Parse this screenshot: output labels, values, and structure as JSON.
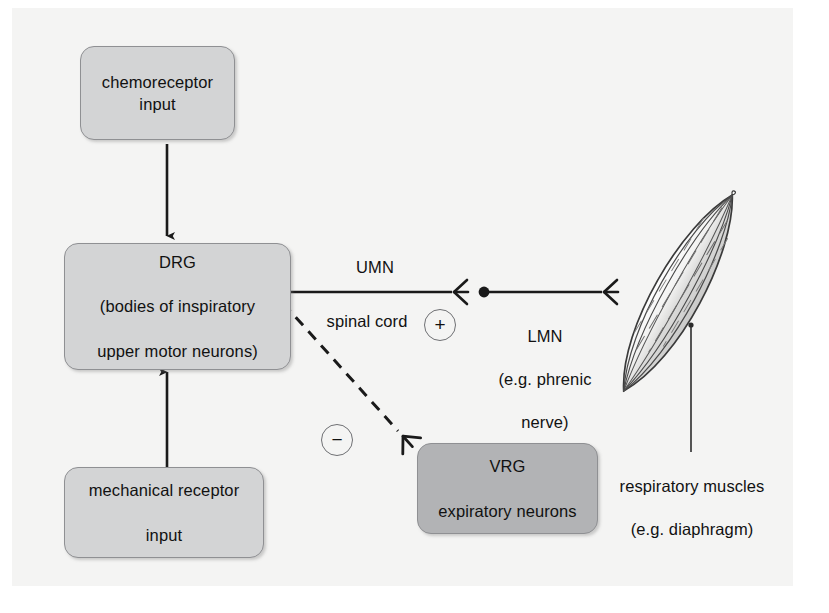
{
  "diagram": {
    "background": "#f4f4f3",
    "box_fill_light": "#d3d4d5",
    "box_fill_dark": "#b2b3b5",
    "stroke": "#1a1a1a"
  },
  "nodes": {
    "chemoreceptor": {
      "label": "chemoreceptor\ninput",
      "line1": "chemoreceptor",
      "line2": "input",
      "fill": "#d3d4d5"
    },
    "drg": {
      "line1": "DRG",
      "line2": "(bodies of inspiratory",
      "line3": "upper motor neurons)",
      "fill": "#d3d4d5"
    },
    "mechanical": {
      "line1": "mechanical receptor",
      "line2": "input",
      "fill": "#d3d4d5"
    },
    "vrg": {
      "line1": "VRG",
      "line2": "expiratory neurons",
      "fill": "#b2b3b5"
    }
  },
  "labels": {
    "umn": "UMN",
    "spinal_cord": "spinal cord",
    "lmn": "LMN\n(e.g. phrenic\nnerve)",
    "lmn_line1": "LMN",
    "lmn_line2": "(e.g. phrenic",
    "lmn_line3": "nerve)",
    "muscles": "respiratory muscles\n(e.g. diaphragm)",
    "muscles_line1": "respiratory muscles",
    "muscles_line2": "(e.g. diaphragm)"
  },
  "signs": {
    "excitatory": "+",
    "inhibitory": "−"
  },
  "icons": {
    "soma": "neuron-soma-icon",
    "synapse_terminal": "synaptic-terminal-icon",
    "muscle": "muscle-spindle-icon"
  },
  "connections": [
    {
      "name": "chemoreceptor-to-drg",
      "from": "chemoreceptor",
      "to": "drg",
      "style": "solid",
      "arrow": "down"
    },
    {
      "name": "mechanical-to-drg",
      "from": "mechanical",
      "to": "drg",
      "style": "solid",
      "arrow": "up"
    },
    {
      "name": "umn-axon",
      "from": "drg-soma",
      "to": "umn-terminal",
      "style": "solid",
      "arrow": "terminal",
      "sign": "+"
    },
    {
      "name": "lmn-axon",
      "from": "lmn-soma",
      "to": "muscle",
      "style": "solid",
      "arrow": "terminal"
    },
    {
      "name": "drg-to-vrg",
      "from": "drg-soma",
      "to": "vrg",
      "style": "dashed",
      "arrow": "terminal",
      "sign": "−"
    },
    {
      "name": "muscle-leader",
      "from": "muscle",
      "to": "muscles-label",
      "style": "solid",
      "arrow": "none"
    }
  ]
}
